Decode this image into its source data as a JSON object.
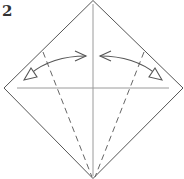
{
  "diagram": {
    "step_label": "2",
    "type": "origami-fold-instruction",
    "colors": {
      "outline": "#555555",
      "crease": "#9a9a9a",
      "fold_line": "#666666",
      "arrow": "#555555",
      "label": "#333333"
    },
    "elements": [
      {
        "kind": "paper-square-diamond",
        "description": "square paper rotated 45 degrees"
      },
      {
        "kind": "crease-line",
        "orientation": "vertical",
        "description": "center vertical crease"
      },
      {
        "kind": "crease-line",
        "orientation": "horizontal",
        "description": "center horizontal crease"
      },
      {
        "kind": "valley-fold-line",
        "side": "left",
        "description": "dashed line from bottom corner to upper-left edge"
      },
      {
        "kind": "valley-fold-line",
        "side": "right",
        "description": "dashed line from bottom corner to upper-right edge"
      },
      {
        "kind": "fold-and-unfold-arrow",
        "side": "left",
        "description": "curved arrow: fold left edge to center and unfold"
      },
      {
        "kind": "fold-and-unfold-arrow",
        "side": "right",
        "description": "curved arrow: fold right edge to center and unfold"
      }
    ]
  }
}
